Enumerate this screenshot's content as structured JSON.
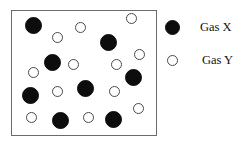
{
  "figure": {
    "width": 247,
    "height": 146,
    "background": "#ffffff"
  },
  "container": {
    "x": 11,
    "y": 10,
    "width": 146,
    "height": 126,
    "border_color": "#6b6b6b",
    "fill_color": "#ffffff"
  },
  "styles": {
    "gas_x_color": "#0d0d0d",
    "gas_y_color": "#ffffff",
    "gas_y_outline": "#4a4a4a",
    "gas_x_diameter": 17,
    "gas_y_diameter": 11
  },
  "chart_data": {
    "type": "scatter",
    "title": "",
    "xlabel": "",
    "ylabel": "",
    "xlim": [
      11,
      157
    ],
    "ylim": [
      10,
      136
    ],
    "grid": false,
    "legend_position": "right",
    "counts": {
      "Gas X": 10,
      "Gas Y": 12
    },
    "series": [
      {
        "name": "Gas X",
        "marker": "filled-circle",
        "color": "#0d0d0d",
        "diameter": 17,
        "points": [
          {
            "x": 33,
            "y": 25
          },
          {
            "x": 52,
            "y": 62
          },
          {
            "x": 108,
            "y": 42
          },
          {
            "x": 30,
            "y": 95
          },
          {
            "x": 85,
            "y": 88
          },
          {
            "x": 133,
            "y": 77
          },
          {
            "x": 60,
            "y": 120
          },
          {
            "x": 113,
            "y": 119
          }
        ]
      },
      {
        "name": "Gas Y",
        "marker": "open-circle",
        "color": "#ffffff",
        "outline": "#4a4a4a",
        "diameter": 11,
        "points": [
          {
            "x": 57,
            "y": 37
          },
          {
            "x": 80,
            "y": 27
          },
          {
            "x": 131,
            "y": 18
          },
          {
            "x": 73,
            "y": 64
          },
          {
            "x": 116,
            "y": 64
          },
          {
            "x": 139,
            "y": 54
          },
          {
            "x": 33,
            "y": 72
          },
          {
            "x": 57,
            "y": 91
          },
          {
            "x": 114,
            "y": 91
          },
          {
            "x": 31,
            "y": 117
          },
          {
            "x": 88,
            "y": 117
          },
          {
            "x": 138,
            "y": 108
          }
        ]
      }
    ]
  },
  "legend": {
    "x": 164,
    "y": 18,
    "entries": [
      {
        "label": "Gas X",
        "marker": "filled-circle",
        "swatch_x": 165,
        "swatch_y": 21,
        "swatch_size": 15,
        "label_x": 189,
        "row_y": 20
      },
      {
        "label": "Gas Y",
        "marker": "open-circle",
        "swatch_x": 167,
        "swatch_y": 56,
        "swatch_size": 11,
        "label_x": 189,
        "row_y": 53
      }
    ]
  }
}
